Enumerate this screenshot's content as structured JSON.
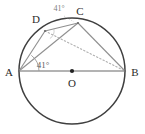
{
  "figure": {
    "canvas": {
      "width": 145,
      "height": 134,
      "background": "#ffffff"
    },
    "colors": {
      "circle_stroke": "#3f3f3f",
      "chord_stroke": "#8f8f8f",
      "dotted_stroke": "#b0b0b0",
      "diameter_stroke": "#9a9a9a",
      "label_text": "#2b2b2b",
      "angle_text": "#7d7d7d",
      "center_dot": "#222222"
    },
    "circle": {
      "cx": 72,
      "cy": 71,
      "r": 53
    },
    "points": [
      {
        "name": "A",
        "x": 19,
        "y": 71,
        "label": "A",
        "label_x": 9,
        "label_y": 72
      },
      {
        "name": "B",
        "x": 125,
        "y": 71,
        "label": "B",
        "label_x": 135,
        "label_y": 72
      },
      {
        "name": "C",
        "x": 78,
        "y": 23,
        "label": "C",
        "label_x": 80,
        "label_y": 11
      },
      {
        "name": "D",
        "x": 45,
        "y": 31,
        "label": "D",
        "label_x": 36,
        "label_y": 19
      },
      {
        "name": "O",
        "x": 72,
        "y": 71,
        "label": "O",
        "label_x": 72,
        "label_y": 83
      }
    ],
    "segments": [
      {
        "name": "A-B-diameter",
        "from": "A",
        "to": "B",
        "style": "solid",
        "color": "#9a9a9a",
        "width": 1.6
      },
      {
        "name": "A-D",
        "from": "A",
        "to": "D",
        "style": "solid",
        "color": "#8f8f8f",
        "width": 1.1
      },
      {
        "name": "A-C",
        "from": "A",
        "to": "C",
        "style": "solid",
        "color": "#8f8f8f",
        "width": 1.1
      },
      {
        "name": "D-C",
        "from": "D",
        "to": "C",
        "style": "solid",
        "color": "#8f8f8f",
        "width": 1.1
      },
      {
        "name": "C-B",
        "from": "C",
        "to": "B",
        "style": "solid",
        "color": "#8f8f8f",
        "width": 1.1
      },
      {
        "name": "D-B",
        "from": "D",
        "to": "B",
        "style": "dotted",
        "color": "#b0b0b0",
        "width": 1.1
      }
    ],
    "angles": [
      {
        "name": "angle-at-A",
        "value": "41°",
        "vertex": "A",
        "label_x": 43,
        "label_y": 65,
        "tone": "dark"
      },
      {
        "name": "angle-at-C-arc",
        "value": "41°",
        "vertex": "C",
        "label_x": 59,
        "label_y": 9,
        "tone": "light"
      }
    ],
    "arc_marks": [
      {
        "name": "angle-arc-at-A",
        "cx": 19,
        "cy": 71,
        "r": 20
      },
      {
        "name": "angle-arc-at-D",
        "cx": 45,
        "cy": 31,
        "r": 9
      }
    ]
  }
}
